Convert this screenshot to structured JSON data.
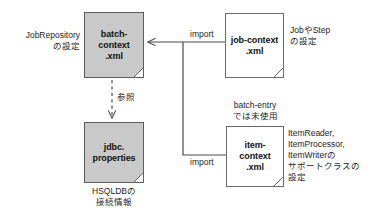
{
  "diagram": {
    "background_color": "#ffffff",
    "shaded_fill": "#c9c9c9",
    "line_color": "#4a4a4a"
  },
  "nodes": {
    "batch_context": {
      "label": "batch-\ncontext\n.xml",
      "style": "shaded"
    },
    "jdbc_properties": {
      "label": "jdbc.\nproperties",
      "style": "shaded"
    },
    "job_context": {
      "label": "job-context\n.xml",
      "style": "plain"
    },
    "item_context": {
      "label": "item-\ncontext\n.xml",
      "style": "plain"
    }
  },
  "captions": {
    "job_repository": "JobRepository\nの設定",
    "hsqldb": "HSQLDBの\n接続情報",
    "job_or_step": "JobやStep\nの設定",
    "batch_entry_unused": "batch-entry\nでは未使用",
    "item_support": "ItemReader,\nItemProcessor,\nItemWriterの\nサポートクラスの\n設定"
  },
  "edges": {
    "import_top": "import",
    "import_bottom": "import",
    "reference": "参照"
  }
}
